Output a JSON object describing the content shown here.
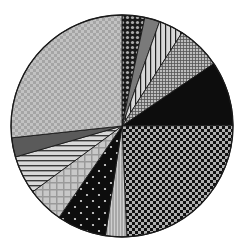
{
  "chart_data": {
    "type": "pie",
    "title": "",
    "legend": "none",
    "center": [
      122,
      126
    ],
    "radius": 111,
    "start_angle_deg": 0,
    "direction": "clockwise",
    "categories": [
      "S1",
      "S2",
      "S3",
      "S4",
      "S5",
      "S6",
      "S7",
      "S8",
      "S9",
      "S10",
      "S11",
      "S12"
    ],
    "values": [
      3.3,
      2.2,
      3.6,
      6.4,
      9.4,
      24.4,
      3.1,
      7.2,
      5.3,
      5.6,
      2.8,
      26.7
    ],
    "slices": [
      {
        "name": "S1",
        "value": 3.3,
        "pattern": "diamond-lattice",
        "bg": "#1a1a1a",
        "fg": "#aaaaaa"
      },
      {
        "name": "S2",
        "value": 2.2,
        "pattern": "solid",
        "bg": "#7a7a7a",
        "fg": "#7a7a7a"
      },
      {
        "name": "S3",
        "value": 3.6,
        "pattern": "vertical-stripes",
        "bg": "#d8d8d8",
        "fg": "#222222"
      },
      {
        "name": "S4",
        "value": 6.4,
        "pattern": "fine-grid",
        "bg": "#bdbdbd",
        "fg": "#555555"
      },
      {
        "name": "S5",
        "value": 9.4,
        "pattern": "solid",
        "bg": "#0d0d0d",
        "fg": "#0d0d0d"
      },
      {
        "name": "S6",
        "value": 24.4,
        "pattern": "checker",
        "bg": "#b0b0b0",
        "fg": "#111111"
      },
      {
        "name": "S7",
        "value": 3.1,
        "pattern": "vertical-fine-stripes",
        "bg": "#a8a8a8",
        "fg": "#cfcfcf"
      },
      {
        "name": "S8",
        "value": 7.2,
        "pattern": "sparse-dots",
        "bg": "#0d0d0d",
        "fg": "#e0e0e0"
      },
      {
        "name": "S9",
        "value": 5.3,
        "pattern": "large-grid",
        "bg": "#c8c8c8",
        "fg": "#9a9a9a"
      },
      {
        "name": "S10",
        "value": 5.6,
        "pattern": "horizontal-stripes",
        "bg": "#d8d8d8",
        "fg": "#3a3a3a"
      },
      {
        "name": "S11",
        "value": 2.8,
        "pattern": "solid",
        "bg": "#5a5a5a",
        "fg": "#5a5a5a"
      },
      {
        "name": "S12",
        "value": 26.7,
        "pattern": "soft-grid",
        "bg": "#c2c2c2",
        "fg": "#a5a5a5"
      }
    ],
    "stroke": "#1a1a1a"
  }
}
